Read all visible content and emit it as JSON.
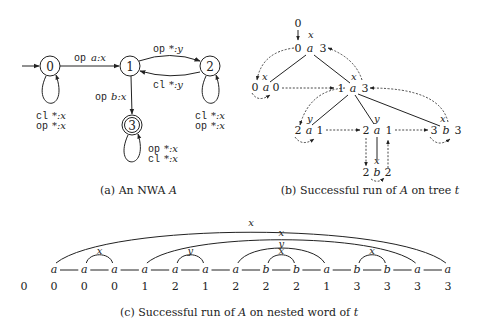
{
  "figure_a": {
    "caption": "(a) An NWA A",
    "caption_prefix": "(a) An NWA ",
    "caption_var": "A",
    "states": [
      {
        "id": "0",
        "initial": true,
        "accepting": false
      },
      {
        "id": "1",
        "initial": false,
        "accepting": false
      },
      {
        "id": "2",
        "initial": false,
        "accepting": false
      },
      {
        "id": "3",
        "initial": false,
        "accepting": true
      }
    ],
    "transitions": [
      {
        "from": "0",
        "to": "1",
        "kw": "op",
        "label": "a:x"
      },
      {
        "from": "1",
        "to": "2",
        "kw": "op",
        "label": "*:y"
      },
      {
        "from": "2",
        "to": "1",
        "kw": "cl",
        "label": "*:y"
      },
      {
        "from": "1",
        "to": "3",
        "kw": "op",
        "label": "b:x"
      }
    ],
    "loops": {
      "s0": [
        "cl *:x",
        "op *:x"
      ],
      "s2": [
        "cl *:x",
        "op *:x"
      ],
      "s3": [
        "op *:x",
        "cl *:x"
      ]
    },
    "labels": {
      "op": "op",
      "cl": "cl",
      "t01": "a:x",
      "t12": "*:y",
      "t21": "*:y",
      "t13": "b:x",
      "star_x": "*:x"
    }
  },
  "figure_b": {
    "caption_prefix": "(b) Successful run of ",
    "caption_var": "A",
    "caption_mid": " on tree ",
    "caption_var2": "t",
    "top_state": "0",
    "nodes": [
      {
        "left": "0",
        "sym": "a",
        "right": "3",
        "stack": "x"
      },
      {
        "left": "0",
        "sym": "a",
        "right": "0",
        "stack": "x"
      },
      {
        "left": "1",
        "sym": "a",
        "right": "3",
        "stack": "x"
      },
      {
        "left": "2",
        "sym": "a",
        "right": "1",
        "stack": "y"
      },
      {
        "left": "2",
        "sym": "a",
        "right": "1",
        "stack": "y"
      },
      {
        "left": "3",
        "sym": "b",
        "right": "3",
        "stack": "x"
      },
      {
        "left": "2",
        "sym": "b",
        "right": "2",
        "stack": "x"
      }
    ]
  },
  "figure_c": {
    "caption_prefix": "(c) Successful run of ",
    "caption_var": "A",
    "caption_mid": " on nested word of ",
    "caption_var2": "t",
    "initial_state": "0",
    "letters": [
      "a",
      "a",
      "a",
      "a",
      "a",
      "a",
      "a",
      "b",
      "b",
      "a",
      "b",
      "b",
      "a",
      "a"
    ],
    "states": [
      "0",
      "0",
      "0",
      "1",
      "2",
      "1",
      "2",
      "2",
      "2",
      "1",
      "3",
      "3",
      "3",
      "3"
    ],
    "arcs": [
      {
        "from": 0,
        "to": 13,
        "label": "x"
      },
      {
        "from": 3,
        "to": 12,
        "label": "x"
      },
      {
        "from": 6,
        "to": 9,
        "label": "y"
      },
      {
        "from": 1,
        "to": 2,
        "label": "x"
      },
      {
        "from": 4,
        "to": 5,
        "label": "y"
      },
      {
        "from": 7,
        "to": 8,
        "label": "x"
      },
      {
        "from": 10,
        "to": 11,
        "label": "x"
      }
    ]
  }
}
